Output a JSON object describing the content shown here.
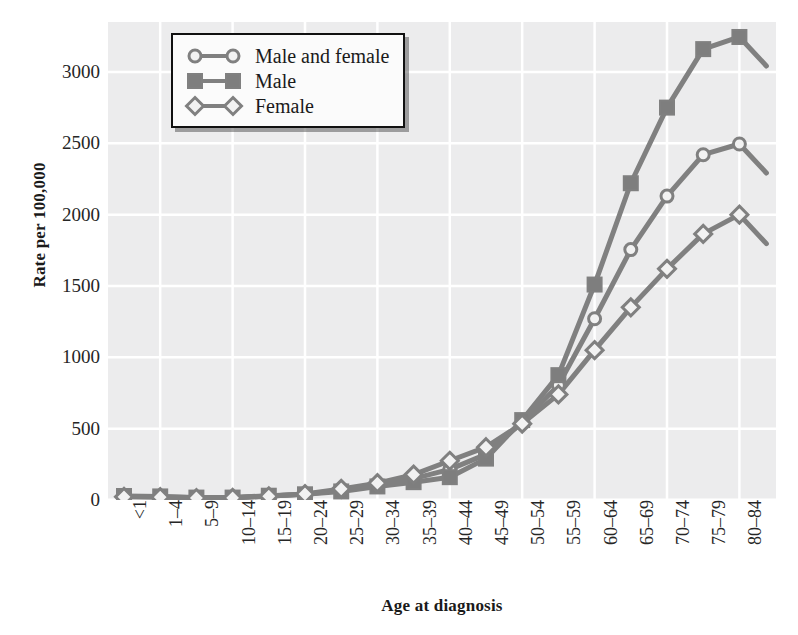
{
  "chart_data": {
    "type": "line",
    "title": "",
    "xlabel": "Age at diagnosis",
    "ylabel": "Rate per 100,000",
    "ylim": [
      0,
      3350
    ],
    "yticks": [
      0,
      500,
      1000,
      1500,
      2000,
      2500,
      3000
    ],
    "ytick_labels": [
      "0",
      "500",
      "1000",
      "1500",
      "2000",
      "2500",
      "3000"
    ],
    "grid": true,
    "legend_position": "top-left",
    "categories": [
      "<1",
      "1–4",
      "5–9",
      "10–14",
      "15–19",
      "20–24",
      "25–29",
      "30–34",
      "35–39",
      "40–44",
      "45–49",
      "50–54",
      "55–59",
      "60–64",
      "65–69",
      "70–74",
      "75–79",
      "80–84"
    ],
    "series": [
      {
        "name": "Male and female",
        "marker": "circle-open",
        "values": [
          25,
          22,
          15,
          16,
          28,
          40,
          68,
          105,
          150,
          215,
          320,
          545,
          805,
          1270,
          1755,
          2130,
          2420,
          2495
        ]
      },
      {
        "name": "Male",
        "marker": "square-filled",
        "values": [
          28,
          25,
          17,
          17,
          30,
          40,
          60,
          95,
          125,
          160,
          290,
          560,
          875,
          1510,
          2220,
          2750,
          3160,
          3245
        ]
      },
      {
        "name": "Female",
        "marker": "diamond-open",
        "values": [
          22,
          20,
          14,
          15,
          26,
          42,
          78,
          118,
          178,
          275,
          370,
          535,
          740,
          1050,
          1350,
          1620,
          1865,
          2000
        ]
      }
    ],
    "colors": {
      "line": "#808080",
      "marker_fill_open": "#f2f2f2",
      "marker_fill_solid": "#7e7e7e",
      "plot_background": "#ececed",
      "gridline": "#ffffff",
      "text": "#262626"
    }
  },
  "legend": {
    "items": [
      {
        "label": "Male and female",
        "marker": "circle-open"
      },
      {
        "label": "Male",
        "marker": "square-filled"
      },
      {
        "label": "Female",
        "marker": "diamond-open"
      }
    ]
  },
  "axes": {
    "y_title": "Rate per 100,000",
    "x_title": "Age at diagnosis"
  }
}
